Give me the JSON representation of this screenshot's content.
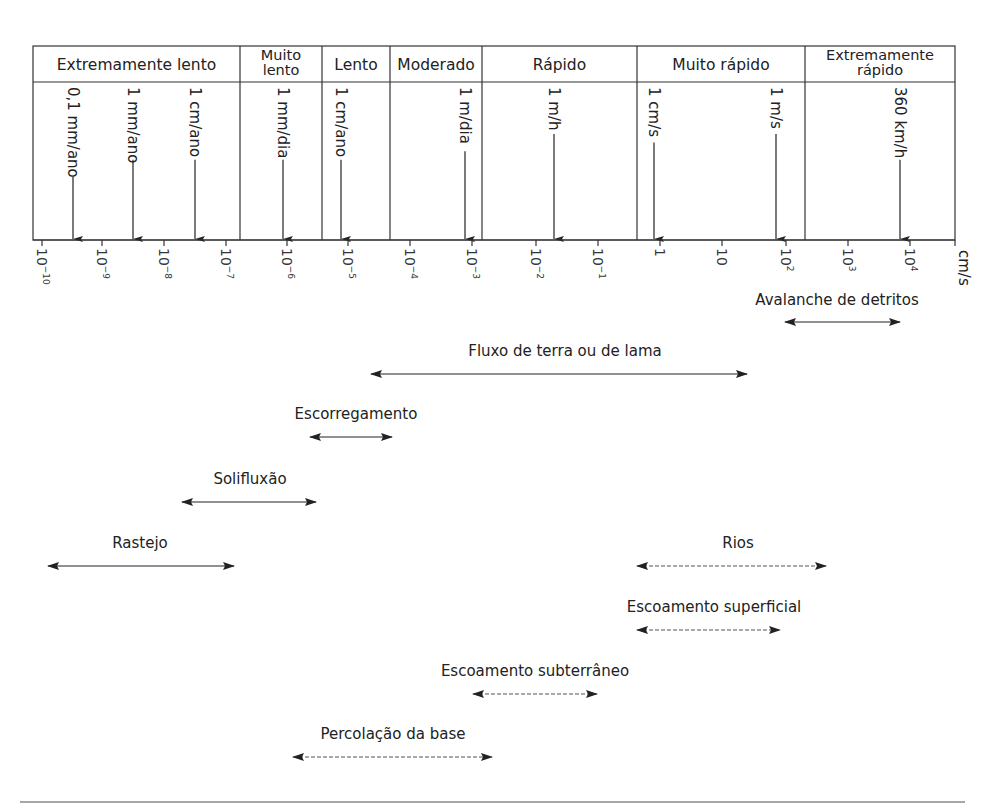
{
  "diagram": {
    "categories": [
      {
        "label_lines": [
          "Extremamente lento"
        ],
        "x0": 33,
        "x1": 240
      },
      {
        "label_lines": [
          "Muito",
          "lento"
        ],
        "x0": 240,
        "x1": 322
      },
      {
        "label_lines": [
          "Lento"
        ],
        "x0": 322,
        "x1": 390
      },
      {
        "label_lines": [
          "Moderado"
        ],
        "x0": 390,
        "x1": 482
      },
      {
        "label_lines": [
          "Rápido"
        ],
        "x0": 482,
        "x1": 637
      },
      {
        "label_lines": [
          "Muito rápido"
        ],
        "x0": 637,
        "x1": 805
      },
      {
        "label_lines": [
          "Extremamente",
          "rápido"
        ],
        "x0": 805,
        "x1": 955
      }
    ],
    "reference_speeds": [
      {
        "label": "0,1 mm/ano",
        "x": 73
      },
      {
        "label": "1 mm/ano",
        "x": 133
      },
      {
        "label": "1 cm/ano",
        "x": 195
      },
      {
        "label": "1 mm/dia",
        "x": 283
      },
      {
        "label": "1 cm/ano",
        "x": 341
      },
      {
        "label": "1 m/dia",
        "x": 465
      },
      {
        "label": "1 m/h",
        "x": 554
      },
      {
        "label": "1 cm/s",
        "x": 654
      },
      {
        "label": "1 m/s",
        "x": 776
      },
      {
        "label": "360 km/h",
        "x": 900
      }
    ],
    "axis": {
      "unit": "cm/s",
      "ticks": [
        {
          "base": "10",
          "exp": "-10",
          "x": 42
        },
        {
          "base": "10",
          "exp": "-9",
          "x": 102
        },
        {
          "base": "10",
          "exp": "-8",
          "x": 164
        },
        {
          "base": "10",
          "exp": "-7",
          "x": 226
        },
        {
          "base": "10",
          "exp": "-6",
          "x": 287
        },
        {
          "base": "10",
          "exp": "-5",
          "x": 348
        },
        {
          "base": "10",
          "exp": "-4",
          "x": 410
        },
        {
          "base": "10",
          "exp": "-3",
          "x": 472
        },
        {
          "base": "10",
          "exp": "-2",
          "x": 536
        },
        {
          "base": "10",
          "exp": "-1",
          "x": 598
        },
        {
          "base": "1",
          "exp": "",
          "x": 660
        },
        {
          "base": "10",
          "exp": "",
          "x": 722
        },
        {
          "base": "10",
          "exp": "2",
          "x": 786
        },
        {
          "base": "10",
          "exp": "3",
          "x": 848
        },
        {
          "base": "10",
          "exp": "4",
          "x": 910
        }
      ]
    },
    "processes": [
      {
        "label": "Avalanche de detritos",
        "x0": 785,
        "x1": 900,
        "y": 322,
        "label_x": 837,
        "label_y": 305,
        "dashed": false
      },
      {
        "label": "Fluxo de terra ou de lama",
        "x0": 371,
        "x1": 747,
        "y": 374,
        "label_x": 565,
        "label_y": 356,
        "dashed": false
      },
      {
        "label": "Escorregamento",
        "x0": 310,
        "x1": 392,
        "y": 437,
        "label_x": 356,
        "label_y": 419,
        "dashed": false
      },
      {
        "label": "Solifluxão",
        "x0": 182,
        "x1": 316,
        "y": 502,
        "label_x": 250,
        "label_y": 484,
        "dashed": false
      },
      {
        "label": "Rastejo",
        "x0": 48,
        "x1": 234,
        "y": 566,
        "label_x": 140,
        "label_y": 548,
        "dashed": false
      },
      {
        "label": "Rios",
        "x0": 637,
        "x1": 826,
        "y": 566,
        "label_x": 738,
        "label_y": 548,
        "dashed": true
      },
      {
        "label": "Escoamento superficial",
        "x0": 637,
        "x1": 780,
        "y": 630,
        "label_x": 714,
        "label_y": 612,
        "dashed": true
      },
      {
        "label": "Escoamento subterrâneo",
        "x0": 473,
        "x1": 597,
        "y": 694,
        "label_x": 535,
        "label_y": 676,
        "dashed": true
      },
      {
        "label": "Percolação da base",
        "x0": 293,
        "x1": 492,
        "y": 757,
        "label_x": 393,
        "label_y": 739,
        "dashed": true
      }
    ]
  },
  "colors": {
    "line": "#222222",
    "dashed": "#555555",
    "rule": "#888888"
  }
}
